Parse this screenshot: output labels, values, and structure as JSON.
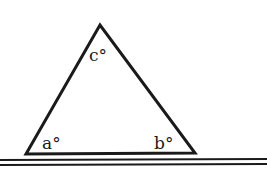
{
  "diagram": {
    "type": "triangle-on-line",
    "vertices": {
      "apex": {
        "x": 100,
        "y": 25
      },
      "left": {
        "x": 26,
        "y": 154
      },
      "right": {
        "x": 195,
        "y": 153
      }
    },
    "labels": {
      "angle_top": "c°",
      "angle_left": "a°",
      "angle_right": "b°"
    },
    "stroke_color": "#1a1a1a",
    "baseline": {
      "y1": 161,
      "y2": 165,
      "x_start": 0,
      "x_end": 267
    }
  }
}
